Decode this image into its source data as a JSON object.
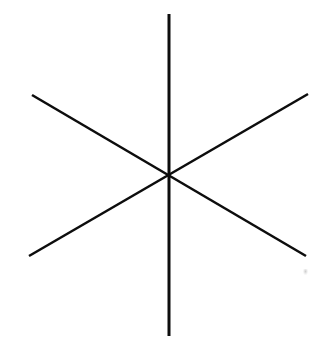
{
  "figure": {
    "canvas": {
      "width": 325,
      "height": 343,
      "background_color": "#ffffff",
      "has_border": false
    },
    "stroke_color": "#0d0d0d",
    "center": {
      "x": 169,
      "y": 175
    },
    "lines": [
      {
        "name": "vertical-line",
        "label": "Vertical line",
        "x1": 169,
        "y1": 14,
        "x2": 169,
        "y2": 336,
        "stroke_width": 3.0,
        "angle_degrees": 90
      },
      {
        "name": "diagonal-line-rising",
        "label": "Rising diagonal line (lower-left to upper-right)",
        "x1": 29,
        "y1": 256,
        "x2": 308,
        "y2": 94,
        "stroke_width": 2.6,
        "angle_degrees": 30
      },
      {
        "name": "diagonal-line-falling",
        "label": "Falling diagonal line (upper-left to lower-right)",
        "x1": 32,
        "y1": 95,
        "x2": 306,
        "y2": 256,
        "stroke_width": 2.6,
        "angle_degrees": -30
      }
    ],
    "artifact": {
      "name": "faint-smudge",
      "label": "Faint grey scan smudge",
      "x": 305,
      "y": 272
    }
  }
}
